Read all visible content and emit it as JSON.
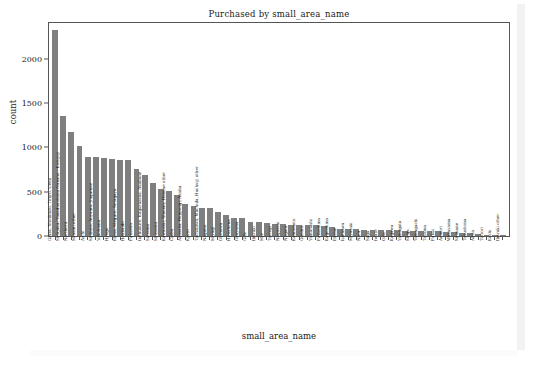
{
  "figure": {
    "background_color": "#ffffff",
    "bar_color": "#7f7f7f",
    "axis_color": "#555555"
  },
  "chart_data": {
    "type": "bar",
    "title": "Purchased by small_area_name",
    "xlabel": "small_area_name",
    "ylabel": "count",
    "ylim": [
      0,
      2400
    ],
    "yticks": [
      0,
      500,
      1000,
      1500,
      2000
    ],
    "ytick_labels": [
      "0",
      "500",
      "1000",
      "1500",
      "2000"
    ],
    "grid": false,
    "legend": null,
    "orientation": "vertical",
    "xtick_rotation": 90,
    "categories": [
      "Ginza, Shinbashi, Tokyo, Ueno",
      "Shinjuku, Takadanobaba Nakano - Kichijoji",
      "Northern",
      "Minami other",
      "Aichi",
      "Shibuya, Aoyama, Jingumae",
      "Yokohama",
      "Hyogo",
      "Ebisu, Meguro, Setagaya",
      "Hokkaido",
      "Fukuoka",
      "Ikebukuro, Kagurazaka, Akabane",
      "Saitama",
      "Shizuoka",
      "Kawasaki, Shonan, Hakone other",
      "Chiba",
      "Akasaka, Roppongi, Azabu",
      "Kyoto",
      "Tachikawa, Machida, Hachioji other",
      "Nagano",
      "Miyagi",
      "Okinawa",
      "Hiroshima",
      "Okayama",
      "Gifu",
      "Ibaraki",
      "Mie",
      "Tochigi",
      "Nagasaki",
      "Niigata",
      "Kumamoto",
      "Gunma",
      "Yamanashi",
      "Fukushima",
      "Kagoshima",
      "Ehime",
      "Ishikawa",
      "Miyazaki",
      "Nara",
      "Saga",
      "Iwate",
      "Oita",
      "Kagawa",
      "Yamagata",
      "Shiga",
      "Yamaguchi",
      "Toyama",
      "Fukui",
      "Aomori",
      "Wakayama",
      "Shimane",
      "Tokushima",
      "Akita",
      "Tottori",
      "Kochi",
      "Ibaraki other"
    ],
    "values": [
      2320,
      1350,
      1175,
      1010,
      890,
      890,
      875,
      865,
      855,
      855,
      760,
      690,
      600,
      530,
      510,
      460,
      365,
      335,
      320,
      315,
      270,
      240,
      205,
      205,
      160,
      158,
      152,
      140,
      130,
      128,
      126,
      125,
      122,
      115,
      100,
      80,
      78,
      76,
      72,
      70,
      68,
      66,
      64,
      62,
      60,
      58,
      56,
      52,
      48,
      42,
      38,
      34,
      20,
      16,
      14,
      10
    ]
  }
}
